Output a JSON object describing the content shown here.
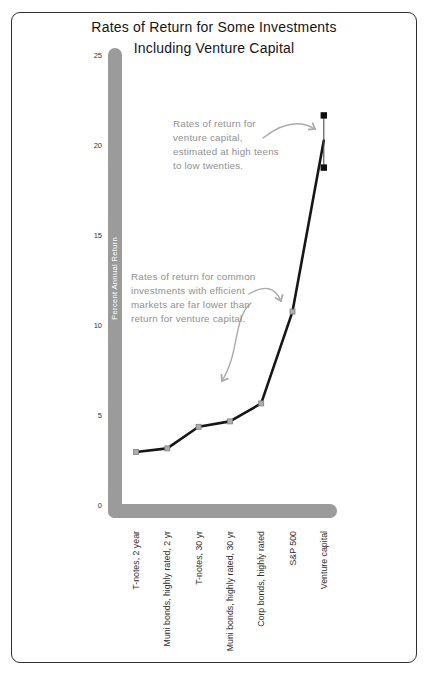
{
  "chart_data": {
    "type": "line",
    "title": "Rates of Return for Some Investments\nIncluding Venture Capital",
    "ylabel": "Percent Annual Return",
    "ylim": [
      0,
      25
    ],
    "yticks": [
      25,
      20,
      15,
      10,
      5,
      0
    ],
    "grid": false,
    "legend": "none",
    "categories": [
      "T-notes, 2 year",
      "Muni bonds, highly rated, 2 yr",
      "T-notes, 30 yr",
      "Muni bonds, highly rated, 30 yr",
      "Corp bonds, highly rated",
      "S&P 500",
      "Venture capital"
    ],
    "values": [
      3,
      3.2,
      4.4,
      4.7,
      5.7,
      10.8,
      20.3
    ],
    "venture_capital_range": [
      18.8,
      21.7
    ],
    "annotations": [
      {
        "text": "Rates of return for\nventure capital,\nestimated at high teens\nto low twenties.",
        "target": "Venture capital"
      },
      {
        "text": "Rates of return for common\ninvestments with efficient\nmarkets are far lower than\nreturn for venture capital.",
        "target": "S&P 500 and bond investments"
      }
    ],
    "colors": {
      "line": "#161616",
      "axis_bar": "#9b9b9b",
      "marker": "#adadad",
      "marker_edge": "#7f7f7f",
      "vc_marker": "#101010",
      "vc_range_line": "#4a4a4a",
      "annotation_text": "#909090",
      "arrow": "#aaaaaa",
      "title_text": "#141414",
      "tick_text": "#333333",
      "ylabel_text": "#ffffff",
      "frame_border": "#2f2f2f"
    }
  }
}
